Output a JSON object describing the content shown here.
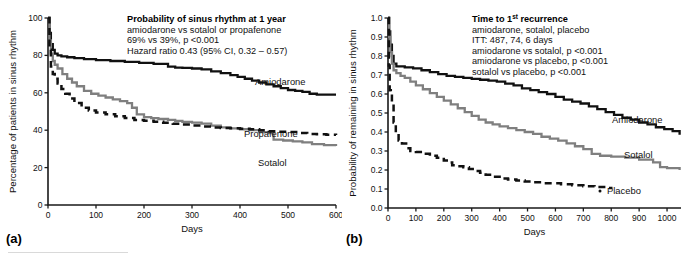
{
  "figure": {
    "panels": [
      {
        "tag": "(a)",
        "annotation": {
          "title": "Probability of sinus rhythm at 1 year",
          "lines": [
            "amiodarone vs sotalol or propafenone",
            "69% vs 39%, p <0.001",
            "Hazard ratio 0.43 (95% CI, 0.32 – 0.57)"
          ]
        },
        "curve_labels": [
          "Amiodarone",
          "Propafenone",
          "Sotalol"
        ]
      },
      {
        "tag": "(b)",
        "annotation": {
          "title_pre": "Time to 1",
          "title_sup": "st",
          "title_post": " recurrence",
          "lines": [
            "amiodarone, sotalol, placebo",
            "ITT: 487, 74, 6 days",
            "amiodarone vs sotalol, p <0.001",
            "amiodarone vs placebo, p <0.001",
            "sotalol vs placebo, p <0.001"
          ]
        },
        "curve_labels": [
          "Amiodarone",
          "Sotalol",
          "Placebo"
        ]
      }
    ]
  },
  "chart_data": [
    {
      "type": "line",
      "panel": "(a)",
      "title": "Probability of sinus rhythm at 1 year",
      "xlabel": "Days",
      "ylabel": "Percentage of patients in sinus rhythm",
      "xlim": [
        0,
        600
      ],
      "ylim": [
        0,
        100
      ],
      "xticks": [
        0,
        100,
        200,
        300,
        400,
        500,
        600
      ],
      "yticks": [
        0,
        20,
        40,
        60,
        80,
        100
      ],
      "grid": false,
      "legend": "inline-curve-labels",
      "step": "post",
      "series": [
        {
          "name": "Amiodarone",
          "color": "#111111",
          "style": "solid",
          "x": [
            0,
            3,
            6,
            10,
            14,
            20,
            28,
            40,
            55,
            75,
            100,
            130,
            160,
            190,
            220,
            250,
            265,
            280,
            300,
            320,
            340,
            360,
            380,
            395,
            410,
            425,
            440,
            455,
            470,
            485,
            500,
            515,
            530,
            545,
            560,
            580,
            600
          ],
          "y": [
            100,
            92,
            86,
            83,
            81,
            80,
            79.5,
            79,
            78.5,
            78,
            77.5,
            77,
            76.5,
            76,
            75.5,
            74,
            73.5,
            73.3,
            73,
            72.5,
            71.5,
            70.5,
            69.5,
            68.5,
            67.5,
            66.5,
            65.5,
            64.5,
            63.5,
            62.5,
            61.5,
            61,
            60.5,
            59.5,
            59,
            59,
            59
          ]
        },
        {
          "name": "Sotalol",
          "color": "#7f7f7f",
          "style": "solid",
          "x": [
            0,
            3,
            6,
            10,
            14,
            20,
            30,
            40,
            50,
            60,
            75,
            90,
            105,
            120,
            135,
            150,
            165,
            175,
            185,
            200,
            215,
            230,
            250,
            265,
            280,
            300,
            320,
            340,
            360,
            380,
            400,
            420,
            440,
            460,
            470,
            490,
            510,
            530,
            550,
            575,
            600
          ],
          "y": [
            100,
            88,
            81,
            77,
            75,
            73,
            70,
            67.5,
            65.5,
            63.5,
            61,
            59.5,
            58.5,
            57.5,
            56.5,
            55.5,
            54.5,
            52,
            48.5,
            47,
            46.5,
            46,
            45.5,
            45,
            44.5,
            44,
            43.5,
            42.5,
            41.5,
            41,
            40.5,
            40,
            39,
            38.5,
            35,
            34.5,
            34,
            33.5,
            32.5,
            32,
            31.5
          ]
        },
        {
          "name": "Propafenone",
          "color": "#111111",
          "style": "dashed",
          "x": [
            0,
            3,
            6,
            10,
            14,
            20,
            28,
            36,
            45,
            55,
            70,
            85,
            100,
            120,
            140,
            160,
            180,
            200,
            220,
            240,
            260,
            280,
            300,
            320,
            340,
            360,
            380,
            400,
            420,
            440,
            460,
            480,
            500,
            520,
            540,
            560,
            580,
            600
          ],
          "y": [
            100,
            83,
            74,
            70,
            67.5,
            65,
            62,
            59.5,
            57,
            54.5,
            52,
            50.5,
            49.5,
            48.5,
            47.5,
            46.5,
            45.5,
            45,
            44.5,
            44,
            43.5,
            43,
            42.5,
            42,
            41.5,
            41.2,
            41,
            40.8,
            40.5,
            40,
            39.5,
            39.2,
            39,
            38.5,
            38,
            37.8,
            37.6,
            37.5
          ]
        }
      ]
    },
    {
      "type": "line",
      "panel": "(b)",
      "title": "Time to 1st recurrence",
      "xlabel": "Days",
      "ylabel": "Probability of remaining in sinus rhythm",
      "xlim": [
        0,
        1050
      ],
      "ylim": [
        0.0,
        1.0
      ],
      "xticks": [
        0,
        100,
        200,
        300,
        400,
        500,
        600,
        700,
        800,
        900,
        1000
      ],
      "yticks": [
        0.0,
        0.1,
        0.2,
        0.3,
        0.4,
        0.5,
        0.6,
        0.7,
        0.8,
        0.9,
        1.0
      ],
      "grid": false,
      "legend": "inline-curve-labels",
      "step": "post",
      "series": [
        {
          "name": "Amiodarone",
          "color": "#111111",
          "style": "solid",
          "x": [
            0,
            4,
            8,
            14,
            20,
            30,
            45,
            60,
            90,
            120,
            150,
            180,
            210,
            240,
            270,
            300,
            330,
            360,
            390,
            420,
            450,
            480,
            510,
            540,
            570,
            600,
            630,
            660,
            690,
            720,
            750,
            780,
            810,
            840,
            870,
            900,
            930,
            960,
            990,
            1020,
            1045
          ],
          "y": [
            1.0,
            0.93,
            0.86,
            0.8,
            0.76,
            0.745,
            0.745,
            0.74,
            0.735,
            0.725,
            0.715,
            0.705,
            0.695,
            0.69,
            0.685,
            0.68,
            0.675,
            0.67,
            0.665,
            0.655,
            0.645,
            0.63,
            0.62,
            0.61,
            0.6,
            0.585,
            0.57,
            0.56,
            0.55,
            0.535,
            0.52,
            0.505,
            0.49,
            0.475,
            0.465,
            0.45,
            0.44,
            0.425,
            0.415,
            0.405,
            0.385
          ]
        },
        {
          "name": "Sotalol",
          "color": "#7f7f7f",
          "style": "solid",
          "x": [
            0,
            4,
            8,
            14,
            20,
            30,
            45,
            60,
            80,
            100,
            125,
            150,
            175,
            200,
            225,
            250,
            275,
            300,
            325,
            350,
            375,
            400,
            430,
            460,
            490,
            520,
            550,
            580,
            610,
            640,
            670,
            700,
            730,
            760,
            800,
            850,
            900,
            950,
            975,
            1000,
            1045
          ],
          "y": [
            1.0,
            0.9,
            0.82,
            0.76,
            0.725,
            0.71,
            0.695,
            0.685,
            0.665,
            0.645,
            0.625,
            0.605,
            0.585,
            0.565,
            0.545,
            0.525,
            0.505,
            0.485,
            0.465,
            0.45,
            0.44,
            0.43,
            0.42,
            0.41,
            0.4,
            0.39,
            0.375,
            0.365,
            0.355,
            0.34,
            0.325,
            0.31,
            0.285,
            0.275,
            0.27,
            0.265,
            0.255,
            0.24,
            0.215,
            0.21,
            0.2
          ]
        },
        {
          "name": "Placebo",
          "color": "#111111",
          "style": "dashed",
          "x": [
            0,
            3,
            6,
            10,
            14,
            20,
            28,
            38,
            50,
            65,
            80,
            100,
            125,
            150,
            175,
            200,
            215,
            230,
            250,
            270,
            290,
            310,
            330,
            350,
            375,
            400,
            430,
            460,
            490,
            520,
            550,
            580,
            620,
            660,
            700,
            740,
            780,
            800
          ],
          "y": [
            1.0,
            0.75,
            0.62,
            0.6,
            0.55,
            0.45,
            0.39,
            0.355,
            0.34,
            0.315,
            0.3,
            0.295,
            0.285,
            0.275,
            0.265,
            0.25,
            0.24,
            0.225,
            0.22,
            0.215,
            0.205,
            0.195,
            0.185,
            0.175,
            0.165,
            0.155,
            0.15,
            0.145,
            0.14,
            0.135,
            0.13,
            0.13,
            0.125,
            0.12,
            0.115,
            0.11,
            0.105,
            0.1
          ]
        }
      ]
    }
  ]
}
